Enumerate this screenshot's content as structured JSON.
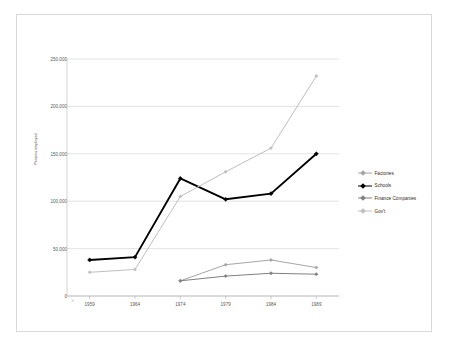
{
  "chart_data": {
    "type": "line",
    "title": "",
    "xlabel": "",
    "ylabel": "Persons employed",
    "categories": [
      "1959",
      "1964",
      "1974",
      "1979",
      "1984",
      "1989"
    ],
    "ylim": [
      0,
      250000
    ],
    "ytick_labels": [
      "0",
      "50,000",
      "100,000",
      "150,000",
      "200,000",
      "250,000"
    ],
    "ytick_values": [
      0,
      50000,
      100000,
      150000,
      200000,
      250000
    ],
    "grid": true,
    "legend_position": "right",
    "series": [
      {
        "name": "Factories",
        "color": "#a6a6a6",
        "x": [
          "1974",
          "1979",
          "1984",
          "1989"
        ],
        "values": [
          16000,
          33000,
          38000,
          30000
        ]
      },
      {
        "name": "Schools",
        "color": "#000000",
        "x": [
          "1959",
          "1964",
          "1974",
          "1979",
          "1984",
          "1989"
        ],
        "values": [
          38000,
          41000,
          124000,
          102000,
          108000,
          150000
        ]
      },
      {
        "name": "Finance Companies",
        "color": "#808080",
        "x": [
          "1974",
          "1979",
          "1984",
          "1989"
        ],
        "values": [
          16000,
          21000,
          24000,
          23000
        ]
      },
      {
        "name": "Gov't",
        "color": "#bfbfbf",
        "x": [
          "1959",
          "1964",
          "1974",
          "1979",
          "1984",
          "1989"
        ],
        "values": [
          25000,
          28000,
          105000,
          131000,
          156000,
          232000
        ]
      }
    ]
  },
  "legend": {
    "items": [
      {
        "label": "Factories"
      },
      {
        "label": "Schools"
      },
      {
        "label": "Finance Companies"
      },
      {
        "label": "Gov't"
      }
    ]
  }
}
